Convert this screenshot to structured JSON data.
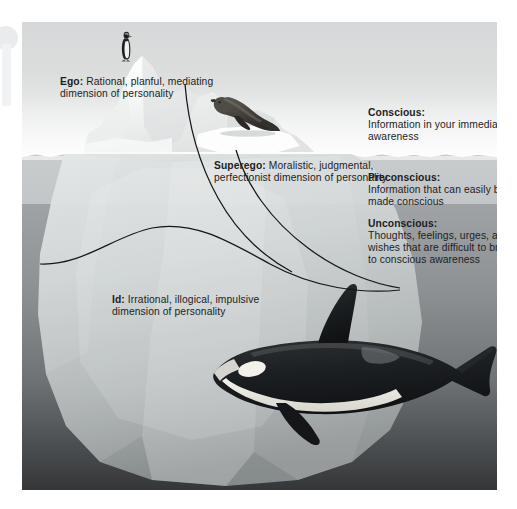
{
  "figure": {
    "scene": {
      "sky_label": "sky",
      "waterline_label": "water surface",
      "animals": [
        "penguin",
        "seal",
        "orca-whale"
      ]
    }
  },
  "structure_labels": [
    {
      "id": "ego",
      "heading": "Ego:",
      "body": " Rational, planful, mediating dimension of personality"
    },
    {
      "id": "superego",
      "heading": "Superego:",
      "body": " Moralistic, judgmental, perfectionist dimension of personality"
    },
    {
      "id": "id",
      "heading": "Id:",
      "body": " Irrational, illogical, impulsive dimension of personality"
    }
  ],
  "level_labels": [
    {
      "id": "conscious",
      "heading": "Conscious:",
      "body": "Information in your immediate awareness"
    },
    {
      "id": "preconscious",
      "heading": "Preconscious:",
      "body": "Information that can easily be made conscious"
    },
    {
      "id": "unconscious",
      "heading": "Unconscious:",
      "body": "Thoughts, feelings, urges, and wishes that are difficult to bring to conscious awareness"
    }
  ],
  "colors": {
    "sky": "#dcdede",
    "water_preconscious": "#c6c9cb",
    "water_unconscious": "#6e7274",
    "deep_water": "#343638",
    "iceberg_above": "#f4f5f5",
    "iceberg_below": "#c9cdce",
    "text": "#1d1d1f",
    "leader_line": "#15161a"
  }
}
